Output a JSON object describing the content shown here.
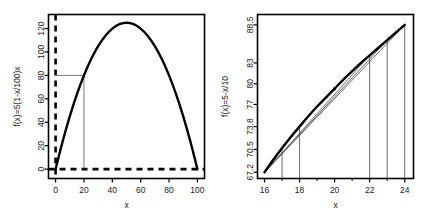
{
  "figure": {
    "panel_count": 2,
    "background": "#ffffff",
    "foreground": "#000000"
  },
  "chart_data": [
    {
      "type": "line",
      "panel": "left",
      "title": "",
      "xlabel": "x",
      "ylabel": "f(x)=5(1-x/100)x",
      "xlim": [
        -5,
        105
      ],
      "ylim": [
        -8,
        132
      ],
      "xticks": [
        0,
        20,
        40,
        60,
        80,
        100
      ],
      "xtick_labels": [
        "0",
        "20",
        "40",
        "60",
        "80",
        "100"
      ],
      "yticks": [
        0,
        20,
        40,
        60,
        80,
        100,
        120
      ],
      "ytick_labels": [
        "0",
        "20",
        "40",
        "60",
        "80",
        "100",
        "120"
      ],
      "grid": false,
      "legend": "none",
      "series": [
        {
          "name": "f(x)=5(1-x/100)x",
          "style": "solid-thick",
          "color": "#000000",
          "x": [
            0,
            5,
            10,
            15,
            20,
            25,
            30,
            35,
            40,
            45,
            50,
            55,
            60,
            65,
            70,
            75,
            80,
            85,
            90,
            95,
            100
          ],
          "y": [
            0,
            23.75,
            45,
            63.75,
            80,
            93.75,
            105,
            113.75,
            120,
            123.75,
            125,
            123.75,
            120,
            113.75,
            105,
            93.75,
            80,
            63.75,
            45,
            23.75,
            0
          ]
        }
      ],
      "annotations": [
        {
          "name": "zero-line-horizontal",
          "type": "hline",
          "y": 0,
          "style": "dashed-thick",
          "color": "#000000"
        },
        {
          "name": "axis-line-vertical",
          "type": "vline",
          "x": 0,
          "style": "dashed-thick",
          "color": "#000000"
        },
        {
          "name": "guide-horizontal-at-80",
          "type": "segment",
          "x0": 0,
          "y0": 80,
          "x1": 20,
          "y1": 80,
          "style": "solid-thin",
          "color": "#555555"
        },
        {
          "name": "guide-vertical-at-20",
          "type": "segment",
          "x0": 20,
          "y0": 0,
          "x1": 20,
          "y1": 80,
          "style": "solid-thin",
          "color": "#555555"
        }
      ]
    },
    {
      "type": "line",
      "panel": "right",
      "title": "",
      "xlabel": "x",
      "ylabel": "f(x)=5-x/10",
      "xlim": [
        15.6,
        24.5
      ],
      "ylim": [
        66.3,
        90.0
      ],
      "xticks": [
        16,
        18,
        20,
        22,
        24
      ],
      "xtick_labels": [
        "16",
        "18",
        "20",
        "22",
        "24"
      ],
      "xminorticks": [
        17,
        19,
        21,
        23
      ],
      "yticks": [
        67.2,
        70.5,
        73.8,
        77,
        80,
        83,
        88.5
      ],
      "ytick_labels": [
        "67.2",
        "70.5",
        "73.8",
        "77",
        "80",
        "83",
        "88.5"
      ],
      "grid": false,
      "legend": "none",
      "series": [
        {
          "name": "f(x)=5-x/10",
          "style": "solid-thick",
          "color": "#000000",
          "x": [
            16,
            16.5,
            17,
            17.5,
            18,
            18.5,
            19,
            19.5,
            20,
            20.5,
            21,
            21.5,
            22,
            22.5,
            23,
            23.5,
            24
          ],
          "y": [
            67.2,
            69.0,
            70.7,
            72.3,
            73.8,
            75.3,
            76.7,
            78.0,
            79.3,
            80.6,
            81.8,
            83.0,
            84.1,
            85.2,
            86.3,
            87.4,
            88.5
          ]
        }
      ],
      "annotations": [
        {
          "name": "secant-16-to-17",
          "type": "segment",
          "x0": 16,
          "y0": 67.2,
          "x1": 17,
          "y1": 70.7,
          "style": "solid-thin",
          "color": "#444444"
        },
        {
          "name": "secant-16-to-18",
          "type": "segment",
          "x0": 16,
          "y0": 67.2,
          "x1": 18,
          "y1": 73.8,
          "style": "solid-thin",
          "color": "#444444"
        },
        {
          "name": "secant-16-to-22",
          "type": "segment",
          "x0": 16,
          "y0": 67.2,
          "x1": 22,
          "y1": 84.1,
          "style": "solid-thin",
          "color": "#444444"
        },
        {
          "name": "secant-16-to-23",
          "type": "segment",
          "x0": 16,
          "y0": 67.2,
          "x1": 23,
          "y1": 86.3,
          "style": "solid-thin",
          "color": "#444444"
        },
        {
          "name": "secant-16-to-24",
          "type": "segment",
          "x0": 16,
          "y0": 67.2,
          "x1": 24,
          "y1": 88.5,
          "style": "solid-thin",
          "color": "#444444"
        },
        {
          "name": "drop-line-17",
          "type": "vsegment",
          "x": 17,
          "y0": 66.3,
          "y1": 70.7,
          "style": "solid-thin",
          "color": "#444444"
        },
        {
          "name": "drop-line-18",
          "type": "vsegment",
          "x": 18,
          "y0": 66.3,
          "y1": 73.8,
          "style": "solid-thin",
          "color": "#444444"
        },
        {
          "name": "drop-line-22",
          "type": "vsegment",
          "x": 22,
          "y0": 66.3,
          "y1": 84.1,
          "style": "solid-thin",
          "color": "#444444"
        },
        {
          "name": "drop-line-23",
          "type": "vsegment",
          "x": 23,
          "y0": 66.3,
          "y1": 86.3,
          "style": "solid-thin",
          "color": "#444444"
        },
        {
          "name": "drop-line-24",
          "type": "vsegment",
          "x": 24,
          "y0": 66.3,
          "y1": 88.5,
          "style": "solid-thin",
          "color": "#444444"
        },
        {
          "name": "marker-point-20",
          "type": "point",
          "x": 20,
          "y": 79.3,
          "color": "#000000"
        }
      ]
    }
  ]
}
